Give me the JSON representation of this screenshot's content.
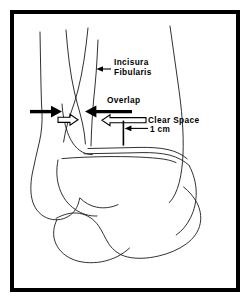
{
  "figure": {
    "background_color": "#ffffff",
    "line_color": "#1a1a1a",
    "frame_color": "#000000",
    "labels": {
      "incisura": "Incisura",
      "fibularis": "Fibularis",
      "overlap": "Overlap",
      "clear_space": "Clear Space",
      "one_cm": "1 cm"
    },
    "annotations": [
      {
        "name": "incisura-fibularis",
        "text_lines": [
          "Incisura",
          "Fibularis"
        ],
        "arrow_style": "thin-leader",
        "arrow_direction": "left"
      },
      {
        "name": "overlap",
        "text_lines": [
          "Overlap"
        ],
        "arrow_style": "solid-black",
        "arrow_direction": "inward-pair"
      },
      {
        "name": "clear-space",
        "text_lines": [
          "Clear Space"
        ],
        "arrow_style": "hollow-white",
        "arrow_direction": "outward-pair"
      },
      {
        "name": "one-cm",
        "text_lines": [
          "1 cm"
        ],
        "arrow_style": "thin-leader-with-bar",
        "arrow_direction": "left"
      }
    ],
    "structures": [
      "tibia-medial-cortex",
      "tibia-lateral-cortex",
      "fibula-medial-cortex",
      "fibula-lateral-cortex",
      "incisura-fibularis-cortex",
      "tibial-plafond",
      "medial-malleolus",
      "lateral-malleolus",
      "talar-dome",
      "talus-body",
      "calcaneus"
    ]
  }
}
